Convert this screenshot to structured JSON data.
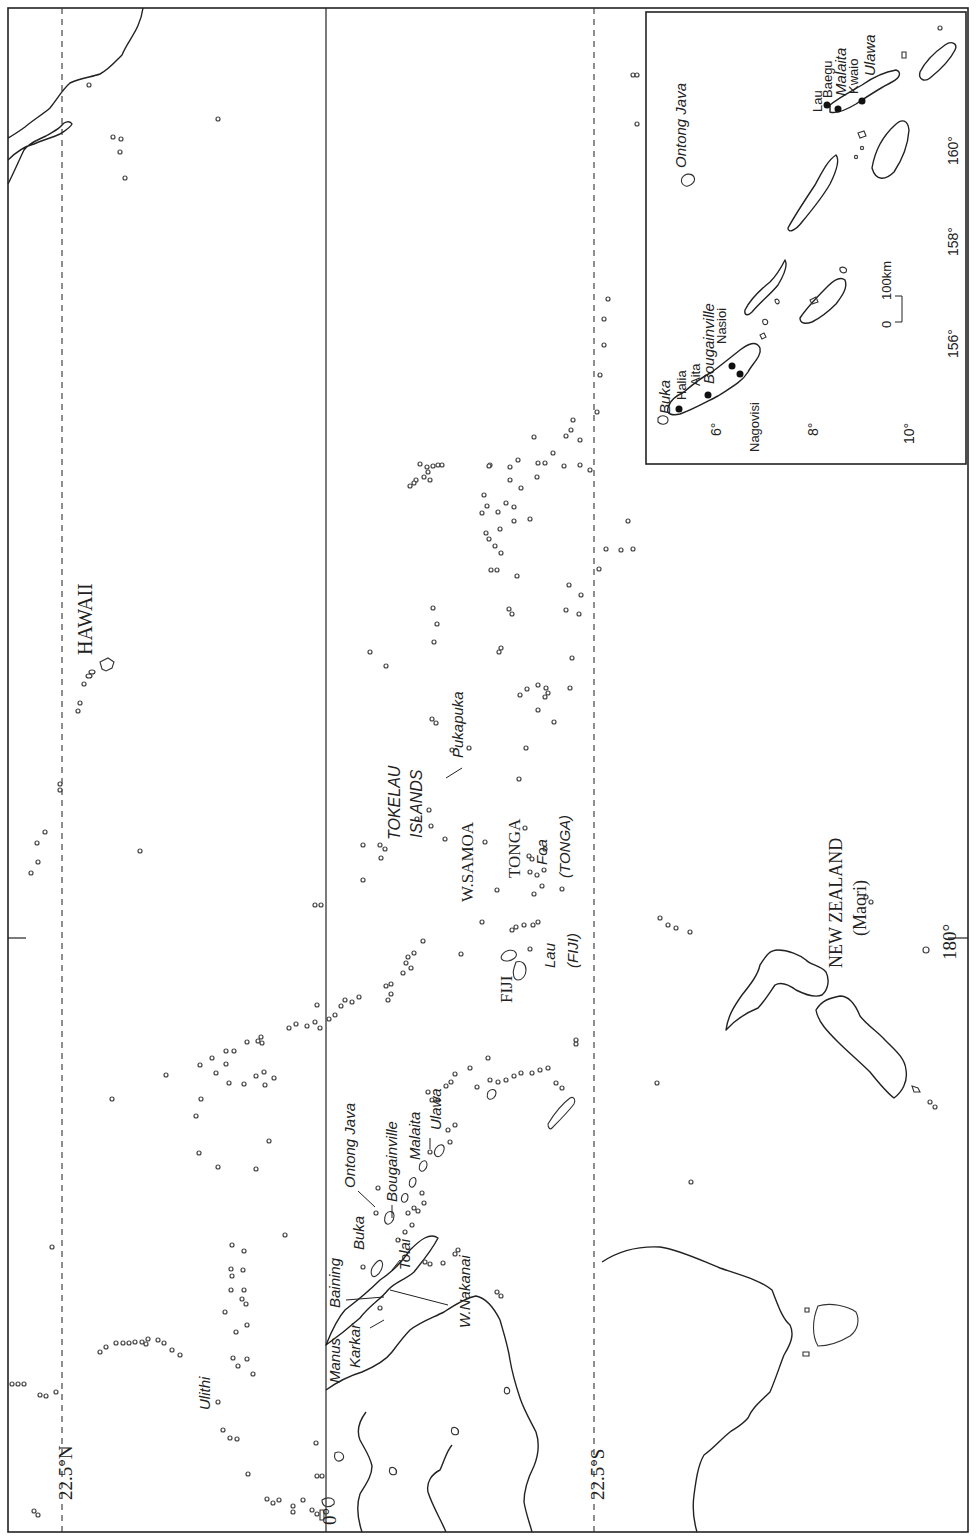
{
  "map": {
    "title": "",
    "orientation": "rotated 90° counter-clockwise (north to the left)",
    "graticule": {
      "lat_22_5N": "22.5°N",
      "lat_0": "0°",
      "lat_22_5S": "22.5°S",
      "lon_180": "180°"
    },
    "regions": {
      "hawaii": "HAWAII",
      "tokelau_1": "TOKELAU",
      "tokelau_2": "ISLANDS",
      "w_samoa": "W.SAMOA",
      "tonga": "TONGA",
      "tonga_paren": "(TONGA)",
      "fiji": "FIJI",
      "fiji_paren": "(FIJI)",
      "new_zealand": "NEW ZEALAND",
      "maori": "(Maori)"
    },
    "places": {
      "pukapuka": "Pukapuka",
      "foa": "Foa",
      "lau": "Lau",
      "ulithi": "Ulithi",
      "manus": "Manus",
      "baining": "Baining",
      "karkar": "Karkar",
      "buka": "Buka",
      "tolai": "Tolai",
      "w_nakanai": "W.Nakanai",
      "ontong_java": "Ontong Java",
      "bougainville": "Bougainville",
      "malaita": "Malaita",
      "ulawa": "Ulawa"
    },
    "inset": {
      "islands": {
        "buka": "Buka",
        "bougainville": "Bougainville",
        "ontong_java": "Ontong Java",
        "malaita": "Malaita",
        "ulawa": "Ulawa"
      },
      "groups": {
        "halia": "Halia",
        "aita": "Aita",
        "nasioi": "Nasioi",
        "nagovisi": "Nagovisi",
        "lau": "Lau",
        "baegu": "Baegu",
        "kwaio": "Kwaio"
      },
      "lat_ticks": [
        "6°",
        "8°",
        "10°"
      ],
      "lon_ticks": [
        "156°",
        "158°",
        "160°"
      ],
      "scale": {
        "zero": "0",
        "length": "100km"
      }
    }
  }
}
